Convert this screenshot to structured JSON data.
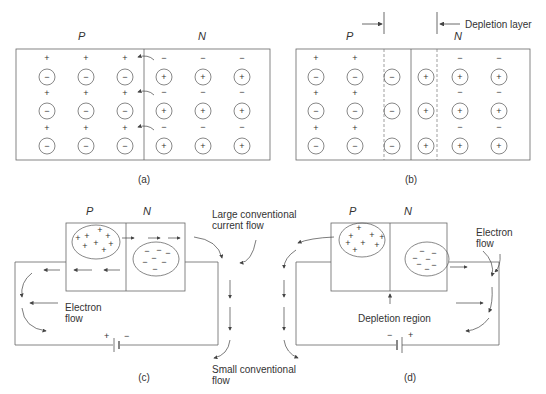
{
  "panels": {
    "a": {
      "caption": "(a)",
      "region_p": "P",
      "region_n": "N",
      "p_side_ion": "−",
      "p_side_carrier": "+",
      "n_side_ion": "+",
      "n_side_carrier": "−"
    },
    "b": {
      "caption": "(b)",
      "region_p": "P",
      "region_n": "N",
      "depletion_label": "Depletion layer",
      "p_side_ion": "−",
      "p_side_carrier": "+",
      "n_side_ion": "+",
      "n_side_carrier": "−"
    },
    "c": {
      "caption": "(c)",
      "region_p": "P",
      "region_n": "N",
      "large_flow_label_1": "Large conventional",
      "large_flow_label_2": "current flow",
      "small_flow_label_1": "Small conventional",
      "small_flow_label_2": "flow",
      "electron_flow_label_1": "Electron",
      "electron_flow_label_2": "flow",
      "battery_plus": "+",
      "battery_minus": "−"
    },
    "d": {
      "caption": "(d)",
      "region_p": "P",
      "region_n": "N",
      "depletion_region_label": "Depletion region",
      "electron_flow_label_1": "Electron",
      "electron_flow_label_2": "flow",
      "battery_plus": "+",
      "battery_minus": "−"
    }
  },
  "colors": {
    "line": "#555555",
    "text": "#333333",
    "background": "#ffffff"
  }
}
